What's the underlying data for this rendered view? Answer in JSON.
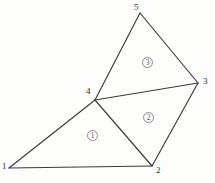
{
  "diagram": {
    "type": "finite-element-mesh",
    "background_color": "#fdfdfc",
    "line_color": "#3b3b40",
    "label_color": "#303036",
    "element_label_color": "#55555c",
    "nodes": [
      {
        "id": "1",
        "label": "1",
        "x": 9,
        "y": 168,
        "label_x": 2,
        "label_y": 162
      },
      {
        "id": "2",
        "label": "2",
        "x": 152,
        "y": 166,
        "label_x": 156,
        "label_y": 166
      },
      {
        "id": "3",
        "label": "3",
        "x": 198,
        "y": 83,
        "label_x": 203,
        "label_y": 77
      },
      {
        "id": "4",
        "label": "4",
        "x": 95,
        "y": 100,
        "label_x": 86,
        "label_y": 87
      },
      {
        "id": "5",
        "label": "5",
        "x": 140,
        "y": 13,
        "label_x": 134,
        "label_y": 3
      }
    ],
    "edges": [
      {
        "id": "edge-1-2",
        "from": "1",
        "to": "2"
      },
      {
        "id": "edge-1-4",
        "from": "1",
        "to": "4"
      },
      {
        "id": "edge-2-4",
        "from": "2",
        "to": "4"
      },
      {
        "id": "edge-2-3",
        "from": "2",
        "to": "3"
      },
      {
        "id": "edge-4-3",
        "from": "4",
        "to": "3"
      },
      {
        "id": "edge-4-5",
        "from": "4",
        "to": "5"
      },
      {
        "id": "edge-5-3",
        "from": "5",
        "to": "3"
      }
    ],
    "elements": [
      {
        "id": "element-1",
        "label": "1",
        "nodes": [
          "1",
          "2",
          "4"
        ],
        "label_x": 87,
        "label_y": 130
      },
      {
        "id": "element-2",
        "label": "2",
        "nodes": [
          "4",
          "2",
          "3"
        ],
        "label_x": 143,
        "label_y": 112
      },
      {
        "id": "element-3",
        "label": "3",
        "nodes": [
          "4",
          "5",
          "3"
        ],
        "label_x": 142,
        "label_y": 57
      }
    ]
  }
}
